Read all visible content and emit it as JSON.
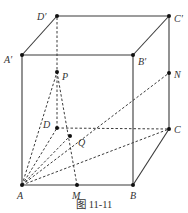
{
  "figure": {
    "caption": "图 11-11",
    "points": {
      "A": {
        "label": "A",
        "x": 22,
        "y": 185
      },
      "B": {
        "label": "B",
        "x": 133,
        "y": 185
      },
      "C": {
        "label": "C",
        "x": 169,
        "y": 129
      },
      "D": {
        "label": "D",
        "x": 57,
        "y": 128
      },
      "A1": {
        "label": "A′",
        "x": 22,
        "y": 55
      },
      "B1": {
        "label": "B′",
        "x": 133,
        "y": 55
      },
      "C1": {
        "label": "C′",
        "x": 169,
        "y": 16
      },
      "D1": {
        "label": "D′",
        "x": 57,
        "y": 16
      },
      "P": {
        "label": "P",
        "x": 57,
        "y": 72
      },
      "N": {
        "label": "N",
        "x": 169,
        "y": 73
      },
      "Q": {
        "label": "Q",
        "x": 70,
        "y": 136
      },
      "M": {
        "label": "M",
        "x": 77,
        "y": 185
      }
    },
    "solid_edges": [
      [
        "A",
        "B"
      ],
      [
        "B",
        "C"
      ],
      [
        "C",
        "C1"
      ],
      [
        "A",
        "A1"
      ],
      [
        "B",
        "B1"
      ],
      [
        "A1",
        "B1"
      ],
      [
        "B1",
        "C1"
      ],
      [
        "A1",
        "D1"
      ],
      [
        "D1",
        "C1"
      ]
    ],
    "dashed_edges": [
      [
        "A",
        "D"
      ],
      [
        "D",
        "C"
      ],
      [
        "D",
        "D1"
      ],
      [
        "A",
        "P"
      ],
      [
        "A",
        "Q"
      ],
      [
        "A",
        "N"
      ],
      [
        "A",
        "C"
      ],
      [
        "P",
        "M"
      ],
      [
        "D",
        "Q"
      ]
    ]
  }
}
